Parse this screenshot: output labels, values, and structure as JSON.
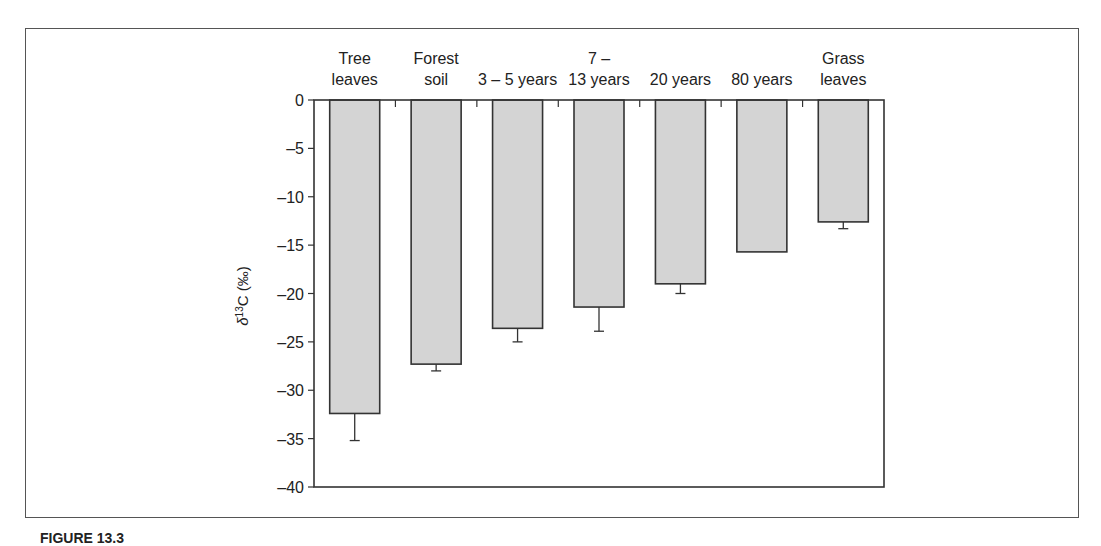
{
  "chart_data": {
    "type": "bar",
    "title": "",
    "xlabel": "",
    "ylabel": "δ13C (‰)",
    "ylabel_parts": {
      "prefix": "δ",
      "sup": "13",
      "suffix": "C (‰)"
    },
    "ylim": [
      -40,
      0
    ],
    "yticks": [
      0,
      -5,
      -10,
      -15,
      -20,
      -25,
      -30,
      -35,
      -40
    ],
    "ytick_labels": [
      "0",
      "–5",
      "–10",
      "–15",
      "–20",
      "–25",
      "–30",
      "–35",
      "–40"
    ],
    "x_axis_position": "top",
    "grid": false,
    "categories": [
      "Tree leaves",
      "Forest soil",
      "3 – 5 years",
      "7 – 13 years",
      "20 years",
      "80 years",
      "Grass leaves"
    ],
    "category_label_lines": [
      [
        "Tree",
        "leaves"
      ],
      [
        "Forest",
        "soil"
      ],
      [
        "",
        "3 – 5 years"
      ],
      [
        "7 –",
        "13 years"
      ],
      [
        "",
        "20 years"
      ],
      [
        "",
        "80 years"
      ],
      [
        "Grass",
        "leaves"
      ]
    ],
    "values": [
      -32.4,
      -27.3,
      -23.6,
      -21.4,
      -19.0,
      -15.7,
      -12.6
    ],
    "error_bars": [
      2.8,
      0.7,
      1.4,
      2.5,
      1.0,
      0.0,
      0.7
    ],
    "bar_color": "#d4d4d4",
    "bar_edge_color": "#333333"
  },
  "caption": {
    "label": "FIGURE 13.3"
  }
}
